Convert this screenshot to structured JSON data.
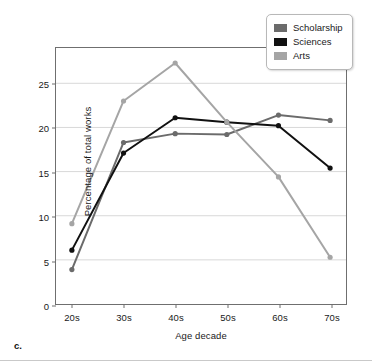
{
  "figure": {
    "caption": "c."
  },
  "legend": {
    "position": "top-right",
    "entries": [
      {
        "label": "Scholarship",
        "color": "#6b6b6b"
      },
      {
        "label": "Sciences",
        "color": "#111111"
      },
      {
        "label": "Arts",
        "color": "#a5a5a5"
      }
    ]
  },
  "axes": {
    "x_label": "Age decade",
    "y_label": "Percentage of total works",
    "y_ticks": [
      "0",
      "5",
      "10",
      "15",
      "20",
      "25"
    ],
    "x_ticks": [
      "20s",
      "30s",
      "40s",
      "50s",
      "60s",
      "70s"
    ]
  },
  "chart_data": {
    "type": "line",
    "title": "",
    "xlabel": "Age decade",
    "ylabel": "Percentage of total works",
    "categories": [
      "20s",
      "30s",
      "40s",
      "50s",
      "60s",
      "70s"
    ],
    "ylim": [
      0,
      29
    ],
    "xlim": [
      0,
      5
    ],
    "yticks": [
      0,
      5,
      10,
      15,
      20,
      25
    ],
    "grid": "horizontal",
    "legend_position": "top-right",
    "markers": "circle",
    "series": [
      {
        "name": "Scholarship",
        "color": "#6b6b6b",
        "values": [
          3.9,
          18.3,
          19.3,
          19.2,
          21.4,
          20.8
        ]
      },
      {
        "name": "Sciences",
        "color": "#111111",
        "values": [
          6.1,
          17.1,
          21.1,
          20.6,
          20.2,
          15.4
        ]
      },
      {
        "name": "Arts",
        "color": "#a5a5a5",
        "values": [
          9.1,
          23.0,
          27.3,
          20.6,
          14.4,
          5.3
        ]
      }
    ]
  }
}
